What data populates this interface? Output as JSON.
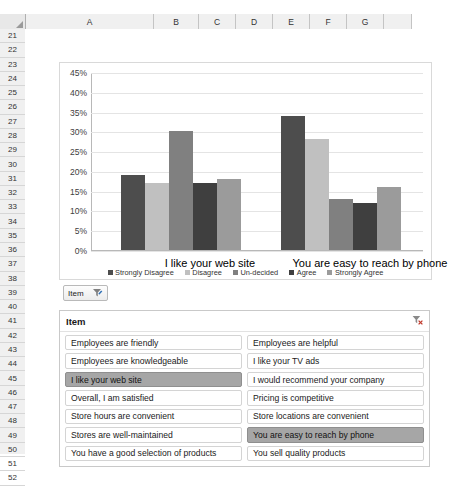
{
  "spreadsheet": {
    "columns": [
      "A",
      "B",
      "C",
      "D",
      "E",
      "F",
      "G"
    ],
    "rows": [
      21,
      22,
      23,
      24,
      25,
      26,
      27,
      28,
      29,
      30,
      31,
      32,
      33,
      34,
      35,
      36,
      37,
      38,
      39,
      40,
      41,
      42,
      43,
      44,
      45,
      46,
      47,
      48,
      49,
      50,
      51,
      52
    ],
    "select_all_icon": "select-all-triangle-icon"
  },
  "chart_data": {
    "type": "bar",
    "title": "",
    "xlabel": "",
    "ylabel": "",
    "ylim": [
      0,
      45
    ],
    "ytick_labels": [
      "0%",
      "5%",
      "10%",
      "15%",
      "20%",
      "25%",
      "30%",
      "35%",
      "40%",
      "45%"
    ],
    "ytick_values": [
      0,
      5,
      10,
      15,
      20,
      25,
      30,
      35,
      40,
      45
    ],
    "grid": true,
    "legend_position": "bottom",
    "categories": [
      "I like your web site",
      "You are easy to reach by phone"
    ],
    "series": [
      {
        "name": "Strongly Disagree",
        "color": "#4d4d4d",
        "values": [
          19,
          34
        ]
      },
      {
        "name": "Disagree",
        "color": "#c0c0c0",
        "values": [
          17,
          28
        ]
      },
      {
        "name": "Un-decided",
        "color": "#808080",
        "values": [
          30,
          13
        ]
      },
      {
        "name": "Agree",
        "color": "#3f3f3f",
        "values": [
          17,
          12
        ]
      },
      {
        "name": "Strongly Agree",
        "color": "#9b9b9b",
        "values": [
          18,
          16
        ]
      }
    ]
  },
  "item_button": {
    "label": "Item",
    "icon": "filter-funnel-icon"
  },
  "slicer": {
    "title": "Item",
    "clear_filter_icon": "clear-filter-icon",
    "columns": [
      {
        "items": [
          {
            "label": "Employees are friendly",
            "selected": false
          },
          {
            "label": "Employees are knowledgeable",
            "selected": false
          },
          {
            "label": "I like your web site",
            "selected": true
          },
          {
            "label": "Overall, I am satisfied",
            "selected": false
          },
          {
            "label": "Store hours are convenient",
            "selected": false
          },
          {
            "label": "Stores are well-maintained",
            "selected": false
          },
          {
            "label": "You have a good selection of products",
            "selected": false
          }
        ]
      },
      {
        "items": [
          {
            "label": "Employees are helpful",
            "selected": false
          },
          {
            "label": "I like your TV ads",
            "selected": false
          },
          {
            "label": "I would recommend your company",
            "selected": false
          },
          {
            "label": "Pricing is competitive",
            "selected": false
          },
          {
            "label": "Store locations are convenient",
            "selected": false
          },
          {
            "label": "You are easy to reach by phone",
            "selected": true
          },
          {
            "label": "You sell quality products",
            "selected": false
          }
        ]
      }
    ]
  }
}
